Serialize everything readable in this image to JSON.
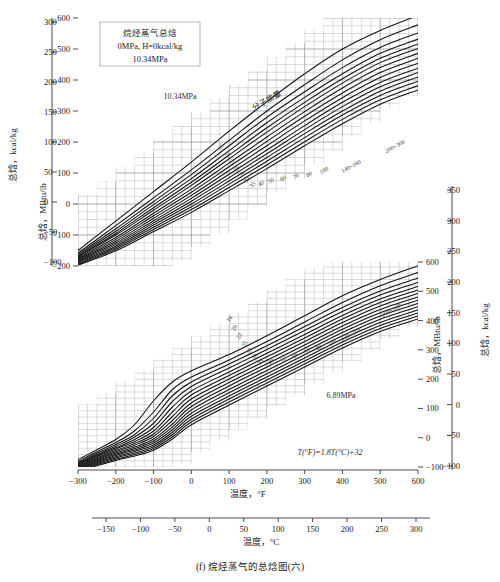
{
  "figure": {
    "caption": "(f) 烷烃蒸气的总焓图(六)",
    "info_box": {
      "line1": "烷烃蒸气总焓",
      "line2": "0MPa, H=0kcal/kg",
      "line3": "10.34MPa"
    },
    "conversion_formula": "T(°F)=1.8T(°C)+32",
    "mw_annotation": "分子质量"
  },
  "axes": {
    "x_fahrenheit": {
      "title": "温度，°F",
      "ticks": [
        -300,
        -200,
        -100,
        0,
        100,
        200,
        300,
        400,
        500,
        600
      ],
      "min": -300,
      "max": 600
    },
    "x_celsius": {
      "title": "温度，°C",
      "ticks": [
        -150,
        -100,
        -50,
        0,
        50,
        100,
        150,
        200,
        250,
        300
      ],
      "min": -184,
      "max": 316
    },
    "top_left_kcal": {
      "title": "总焓，kcal/kg",
      "ticks": [
        -100,
        -50,
        0,
        50,
        100,
        150,
        200,
        250,
        300
      ],
      "min": -111,
      "max": 333
    },
    "top_left_mbtu": {
      "title": "总焓，MBtu/lb",
      "ticks": [
        -200,
        -100,
        0,
        100,
        200,
        300,
        400,
        500,
        600
      ],
      "min": -200,
      "max": 600
    },
    "bottom_right_mbtu": {
      "title": "总焓，MBtu/lb",
      "ticks": [
        -100,
        0,
        100,
        200,
        300,
        400,
        500,
        600
      ],
      "min": -180,
      "max": 640
    },
    "bottom_right_kcal": {
      "title": "总焓，kcal/kg",
      "ticks": [
        -100,
        -50,
        0,
        50,
        100,
        150,
        200,
        250,
        300,
        350
      ],
      "min": -100,
      "max": 355
    }
  },
  "chart_data": {
    "type": "line",
    "title": "烷烃蒸气的总焓图(六)",
    "xlabel": "温度，°F",
    "ylabel": "总焓，MBtu/lb",
    "grid": true,
    "legend": "none",
    "panels": [
      {
        "name": "top",
        "pressure_label": "10.34MPa",
        "pressure_mpa": 10.34,
        "xlim": [
          -300,
          600
        ],
        "ylim": [
          -200,
          600
        ],
        "series": [
          {
            "name": "16",
            "mw": 16,
            "x": [
              -300,
              -200,
              -100,
              0,
              100,
              200,
              300,
              400,
              500,
              600
            ],
            "values": [
              -150,
              -55,
              40,
              135,
              235,
              330,
              420,
              500,
              560,
              608
            ]
          },
          {
            "name": "20",
            "mw": 20,
            "x": [
              -300,
              -200,
              -100,
              0,
              100,
              200,
              300,
              400,
              500,
              600
            ],
            "values": [
              -158,
              -70,
              20,
              110,
              205,
              300,
              385,
              465,
              530,
              578
            ]
          },
          {
            "name": "22",
            "mw": 22,
            "x": [
              -300,
              -200,
              -100,
              0,
              100,
              200,
              300,
              400,
              500,
              600
            ],
            "values": [
              -162,
              -80,
              8,
              95,
              188,
              280,
              362,
              440,
              505,
              552
            ]
          },
          {
            "name": "25",
            "mw": 25,
            "x": [
              -300,
              -200,
              -100,
              0,
              100,
              200,
              300,
              400,
              500,
              600
            ],
            "values": [
              -165,
              -88,
              -2,
              82,
              172,
              262,
              344,
              420,
              486,
              532
            ]
          },
          {
            "name": "28",
            "mw": 28,
            "x": [
              -300,
              -200,
              -100,
              0,
              100,
              200,
              300,
              400,
              500,
              600
            ],
            "values": [
              -168,
              -95,
              -12,
              70,
              158,
              246,
              328,
              404,
              470,
              516
            ]
          },
          {
            "name": "30",
            "mw": 30,
            "x": [
              -300,
              -200,
              -100,
              0,
              100,
              200,
              300,
              400,
              500,
              600
            ],
            "values": [
              -170,
              -100,
              -20,
              60,
              146,
              232,
              314,
              390,
              456,
              502
            ]
          },
          {
            "name": "35",
            "mw": 35,
            "x": [
              -300,
              -200,
              -100,
              0,
              100,
              200,
              300,
              400,
              500,
              600
            ],
            "values": [
              -173,
              -108,
              -30,
              48,
              132,
              216,
              298,
              374,
              440,
              486
            ]
          },
          {
            "name": "40",
            "mw": 40,
            "x": [
              -300,
              -200,
              -100,
              0,
              100,
              200,
              300,
              400,
              500,
              600
            ],
            "values": [
              -176,
              -114,
              -38,
              38,
              120,
              202,
              283,
              358,
              424,
              470
            ]
          },
          {
            "name": "50",
            "mw": 50,
            "x": [
              -300,
              -200,
              -100,
              0,
              100,
              200,
              300,
              400,
              500,
              600
            ],
            "values": [
              -179,
              -120,
              -46,
              28,
              108,
              188,
              268,
              343,
              408,
              454
            ]
          },
          {
            "name": "60",
            "mw": 60,
            "x": [
              -300,
              -200,
              -100,
              0,
              100,
              200,
              300,
              400,
              500,
              600
            ],
            "values": [
              -182,
              -126,
              -54,
              18,
              96,
              174,
              253,
              328,
              392,
              438
            ]
          },
          {
            "name": "70",
            "mw": 70,
            "x": [
              -300,
              -200,
              -100,
              0,
              100,
              200,
              300,
              400,
              500,
              600
            ],
            "values": [
              -185,
              -131,
              -61,
              9,
              85,
              162,
              240,
              314,
              378,
              424
            ]
          },
          {
            "name": "80",
            "mw": 80,
            "x": [
              -300,
              -200,
              -100,
              0,
              100,
              200,
              300,
              400,
              500,
              600
            ],
            "values": [
              -188,
              -136,
              -68,
              0,
              74,
              150,
              227,
              300,
              364,
              410
            ]
          },
          {
            "name": "100",
            "mw": 100,
            "x": [
              -300,
              -200,
              -100,
              0,
              100,
              200,
              300,
              400,
              500,
              600
            ],
            "values": [
              -191,
              -141,
              -75,
              -9,
              64,
              138,
              214,
              287,
              350,
              396
            ]
          },
          {
            "name": "140~160",
            "mw": 150,
            "x": [
              -300,
              -200,
              -100,
              0,
              100,
              200,
              300,
              400,
              500,
              600
            ],
            "values": [
              -194,
              -146,
              -82,
              -18,
              53,
              126,
              201,
              273,
              336,
              382
            ]
          },
          {
            "name": "200~300",
            "mw": 250,
            "x": [
              -300,
              -200,
              -100,
              0,
              100,
              200,
              300,
              400,
              500,
              600
            ],
            "values": [
              -197,
              -151,
              -89,
              -27,
              43,
              114,
              188,
              259,
              322,
              368
            ]
          }
        ]
      },
      {
        "name": "bottom",
        "pressure_label": "6.89MPa",
        "pressure_mpa": 6.89,
        "xlim": [
          -300,
          600
        ],
        "ylim": [
          -180,
          640
        ],
        "series": [
          {
            "name": "16",
            "mw": 16,
            "x": [
              -300,
              -200,
              -150,
              -100,
              -50,
              0,
              100,
              200,
              300,
              400,
              500,
              600
            ],
            "values": [
              -150,
              -70,
              -10,
              85,
              160,
              205,
              270,
              345,
              425,
              505,
              570,
              625
            ]
          },
          {
            "name": "20",
            "mw": 20,
            "x": [
              -300,
              -200,
              -150,
              -100,
              -50,
              0,
              100,
              200,
              300,
              400,
              500,
              600
            ],
            "values": [
              -156,
              -82,
              -35,
              40,
              130,
              180,
              248,
              322,
              400,
              478,
              545,
              598
            ]
          },
          {
            "name": "22",
            "mw": 22,
            "x": [
              -300,
              -200,
              -150,
              -100,
              -50,
              0,
              100,
              200,
              300,
              400,
              500,
              600
            ],
            "values": [
              -160,
              -90,
              -50,
              15,
              105,
              160,
              232,
              305,
              382,
              458,
              524,
              576
            ]
          },
          {
            "name": "25",
            "mw": 25,
            "x": [
              -300,
              -200,
              -150,
              -100,
              -50,
              0,
              100,
              200,
              300,
              400,
              500,
              600
            ],
            "values": [
              -163,
              -97,
              -60,
              -5,
              82,
              142,
              216,
              290,
              366,
              442,
              508,
              558
            ]
          },
          {
            "name": "28",
            "mw": 28,
            "x": [
              -300,
              -200,
              -150,
              -100,
              -50,
              0,
              100,
              200,
              300,
              400,
              500,
              600
            ],
            "values": [
              -166,
              -103,
              -70,
              -22,
              60,
              124,
              200,
              275,
              350,
              426,
              492,
              542
            ]
          },
          {
            "name": "30",
            "mw": 30,
            "x": [
              -300,
              -200,
              -150,
              -100,
              -50,
              0,
              100,
              200,
              300,
              400,
              500,
              600
            ],
            "values": [
              -169,
              -108,
              -78,
              -36,
              40,
              108,
              186,
              261,
              336,
              412,
              478,
              528
            ]
          },
          {
            "name": "35",
            "mw": 35,
            "x": [
              -300,
              -200,
              -150,
              -100,
              -50,
              0,
              100,
              200,
              300,
              400,
              500,
              600
            ],
            "values": [
              -172,
              -114,
              -86,
              -48,
              22,
              92,
              172,
              247,
              322,
              398,
              464,
              514
            ]
          },
          {
            "name": "40",
            "mw": 40,
            "x": [
              -300,
              -200,
              -150,
              -100,
              -50,
              0,
              100,
              200,
              300,
              400,
              500,
              600
            ],
            "values": [
              -175,
              -119,
              -93,
              -58,
              6,
              76,
              158,
              233,
              308,
              384,
              450,
              500
            ]
          },
          {
            "name": "50",
            "mw": 50,
            "x": [
              -300,
              -200,
              -150,
              -100,
              -50,
              0,
              100,
              200,
              300,
              400,
              500,
              600
            ],
            "values": [
              -178,
              -124,
              -100,
              -68,
              -8,
              62,
              144,
              220,
              295,
              371,
              437,
              487
            ]
          },
          {
            "name": "60",
            "mw": 60,
            "x": [
              -300,
              -200,
              -150,
              -100,
              -50,
              0,
              100,
              200,
              300,
              400,
              500,
              600
            ],
            "values": [
              -181,
              -129,
              -106,
              -76,
              -20,
              48,
              130,
              206,
              282,
              358,
              424,
              474
            ]
          },
          {
            "name": "70",
            "mw": 70,
            "x": [
              -300,
              -200,
              -150,
              -100,
              -50,
              0,
              100,
              200,
              300,
              400,
              500,
              600
            ],
            "values": [
              -184,
              -134,
              -112,
              -84,
              -31,
              35,
              117,
              193,
              269,
              345,
              411,
              461
            ]
          },
          {
            "name": "80",
            "mw": 80,
            "x": [
              -300,
              -200,
              -150,
              -100,
              -50,
              0,
              100,
              200,
              300,
              400,
              500,
              600
            ],
            "values": [
              -187,
              -139,
              -118,
              -92,
              -41,
              23,
              104,
              180,
              256,
              332,
              398,
              448
            ]
          },
          {
            "name": "100",
            "mw": 100,
            "x": [
              -300,
              -200,
              -150,
              -100,
              -50,
              0,
              100,
              200,
              300,
              400,
              500,
              600
            ],
            "values": [
              -190,
              -144,
              -124,
              -99,
              -50,
              11,
              92,
              168,
              244,
              320,
              386,
              436
            ]
          },
          {
            "name": "140~160",
            "mw": 150,
            "x": [
              -300,
              -200,
              -150,
              -100,
              -50,
              0,
              100,
              200,
              300,
              400,
              500,
              600
            ],
            "values": [
              -193,
              -149,
              -130,
              -106,
              -59,
              0,
              80,
              156,
              232,
              308,
              374,
              424
            ]
          },
          {
            "name": "200~300",
            "mw": 250,
            "x": [
              -300,
              -200,
              -150,
              -100,
              -50,
              0,
              100,
              200,
              300,
              400,
              500,
              600
            ],
            "values": [
              -196,
              -154,
              -136,
              -113,
              -68,
              -11,
              68,
              144,
              220,
              296,
              362,
              412
            ]
          }
        ]
      }
    ],
    "mw_labels_top": [
      "16",
      "20",
      "22",
      "25",
      "28",
      "30",
      "35",
      "40",
      "50",
      "60",
      "70",
      "80",
      "100",
      "140~160",
      "200~300"
    ],
    "mw_labels_bottom": [
      "16",
      "20",
      "22",
      "25",
      "28",
      "30",
      "35",
      "40",
      "50",
      "60",
      "70",
      "80",
      "100",
      "140~160",
      "200~300"
    ]
  }
}
